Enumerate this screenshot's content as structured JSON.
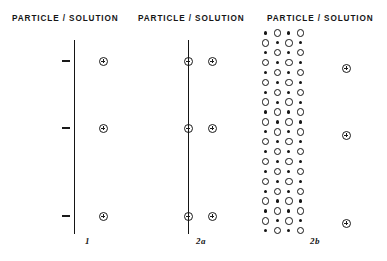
{
  "figure": {
    "headers": [
      {
        "text": "PARTICLE / SOLUTION"
      },
      {
        "text": "PARTICLE / SOLUTION"
      },
      {
        "text": "PARTICLE / SOLUTION"
      }
    ],
    "panels": [
      {
        "id": "panel-1",
        "label": "1",
        "interface_line": {
          "x": 74,
          "y_top": 40,
          "y_bottom": 234
        },
        "surface_charges": {
          "glyph": "minus-sign",
          "sign": "-",
          "x": 62,
          "ys": [
            60,
            127,
            215
          ]
        },
        "solution_ions": {
          "glyph": "circled-plus",
          "sign": "+",
          "x": 99,
          "ys": [
            57,
            124,
            212
          ]
        }
      },
      {
        "id": "panel-2a",
        "label": "2a",
        "interface_line": {
          "x": 188,
          "y_top": 40,
          "y_bottom": 234
        },
        "surface_charges": {
          "glyph": "circled-minus",
          "sign": "-",
          "x": 184,
          "ys": [
            57,
            124,
            212
          ]
        },
        "solution_ions": {
          "glyph": "circled-plus",
          "sign": "+",
          "x": 208,
          "ys": [
            57,
            124,
            212
          ]
        }
      },
      {
        "id": "panel-2b",
        "label": "2b",
        "lattice": {
          "origin_x": 262,
          "origin_y": 28,
          "rows": 21,
          "cols": 4,
          "col_spacing": 11.6,
          "row_spacing": 9.9,
          "small_dot_diameter": 3.2,
          "large_circle_diameter": 7.4,
          "pattern": "checkerboard-alternating-small-dot-and-open-circle",
          "row_parity_note": "even rows start with small dot, odd rows start with large open circle"
        },
        "solution_ions": {
          "glyph": "circled-plus",
          "sign": "+",
          "x": 342,
          "ys": [
            64,
            131,
            219
          ]
        }
      }
    ],
    "colors": {
      "ink": "#1a1a1a",
      "background": "#ffffff"
    }
  }
}
